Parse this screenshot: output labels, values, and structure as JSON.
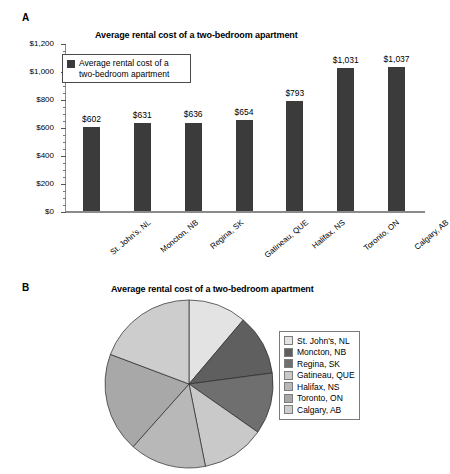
{
  "panels": {
    "a_letter": "A",
    "b_letter": "B"
  },
  "bar_title": "Average rental cost of a two-bedroom apartment",
  "pie_title": "Average rental cost of a two-bedroom apartment",
  "bar_legend_label": "Average rental cost of a two-bedroom apartment",
  "colors": {
    "bar": "#3b3b3b",
    "axis": "#8a8a8a",
    "slice_1": "#e3e3e3",
    "slice_2": "#5f5f5f",
    "slice_3": "#6f6f6f",
    "slice_4": "#c9c9c9",
    "slice_5": "#b8b8b8",
    "slice_6": "#a8a8a8",
    "slice_7": "#cdcdcd"
  },
  "chart_data": [
    {
      "type": "bar",
      "title": "Average rental cost of a two-bedroom apartment",
      "xlabel": "",
      "ylabel": "",
      "ylim": [
        0,
        1200
      ],
      "yticks": [
        0,
        200,
        400,
        600,
        800,
        1000,
        1200
      ],
      "ytick_labels": [
        "$0",
        "$200",
        "$400",
        "$600",
        "$800",
        "$1,000",
        "$1,200"
      ],
      "grid": false,
      "legend_position": "upper-left-inside",
      "legend_entries": [
        "Average rental cost of a two-bedroom apartment"
      ],
      "categories": [
        "St. John's, NL",
        "Moncton, NB",
        "Regina, SK",
        "Gatineau, QUE",
        "Halifax, NS",
        "Toronto, ON",
        "Calgary, AB"
      ],
      "values": [
        602,
        631,
        636,
        654,
        793,
        1031,
        1037
      ],
      "data_labels": [
        "$602",
        "$631",
        "$636",
        "$654",
        "$793",
        "$1,031",
        "$1,037"
      ]
    },
    {
      "type": "pie",
      "title": "Average rental cost of a two-bedroom apartment",
      "legend_position": "right",
      "labels": [
        "St. John's, NL",
        "Moncton, NB",
        "Regina, SK",
        "Gatineau, QUE",
        "Halifax, NS",
        "Toronto, ON",
        "Calgary, AB"
      ],
      "values": [
        602,
        631,
        636,
        654,
        793,
        1031,
        1037
      ],
      "total": 5384,
      "slice_colors": [
        "#e3e3e3",
        "#5f5f5f",
        "#6f6f6f",
        "#c9c9c9",
        "#b8b8b8",
        "#a8a8a8",
        "#cdcdcd"
      ]
    }
  ]
}
